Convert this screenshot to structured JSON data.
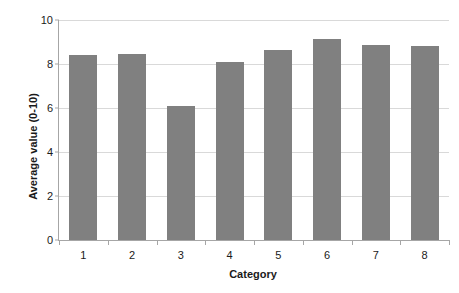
{
  "chart_data": {
    "type": "bar",
    "title": "",
    "subtitle": "",
    "xlabel": "Category",
    "ylabel": "Average value (0-10)",
    "categories": [
      "1",
      "2",
      "3",
      "4",
      "5",
      "6",
      "7",
      "8"
    ],
    "values": [
      8.4,
      8.45,
      6.1,
      8.1,
      8.65,
      9.15,
      8.85,
      8.8
    ],
    "series": [
      {
        "name": "Average value",
        "values": [
          8.4,
          8.45,
          6.1,
          8.1,
          8.65,
          9.15,
          8.85,
          8.8
        ]
      }
    ],
    "ylim": [
      0,
      10
    ],
    "yticks": [
      0,
      2,
      4,
      6,
      8,
      10
    ],
    "ytick_labels": [
      "0",
      "2",
      "4",
      "6",
      "8",
      "10"
    ],
    "grid": true,
    "grid_axis": "y",
    "legend": false,
    "legend_position": "none",
    "bar_color": "#808080",
    "gridline_color": "#d9d9d9",
    "axis_color": "#a6a6a6",
    "text_color": "#1a1a1a",
    "background": "#ffffff",
    "annotations": []
  }
}
